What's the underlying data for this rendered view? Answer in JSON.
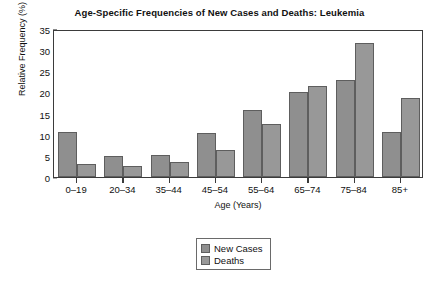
{
  "chart_data": {
    "type": "bar",
    "title": "Age-Specific Frequencies of New Cases and Deaths: Leukemia",
    "xlabel": "Age (Years)",
    "ylabel": "Relative Frequency (%)",
    "categories": [
      "0–19",
      "20–34",
      "35–44",
      "45–54",
      "55–64",
      "65–74",
      "75–84",
      "85+"
    ],
    "series": [
      {
        "name": "New Cases",
        "values": [
          10.7,
          5.0,
          5.2,
          10.3,
          15.8,
          20.2,
          23.0,
          10.7
        ],
        "color": "#8f8f8f"
      },
      {
        "name": "Deaths",
        "values": [
          3.0,
          2.7,
          3.5,
          6.3,
          12.5,
          21.5,
          31.8,
          18.6
        ],
        "color": "#989898"
      }
    ],
    "ylim": [
      0,
      35
    ],
    "yticks": [
      0,
      5,
      10,
      15,
      20,
      25,
      30,
      35
    ],
    "grid": false,
    "legend_position": "bottom-center"
  }
}
